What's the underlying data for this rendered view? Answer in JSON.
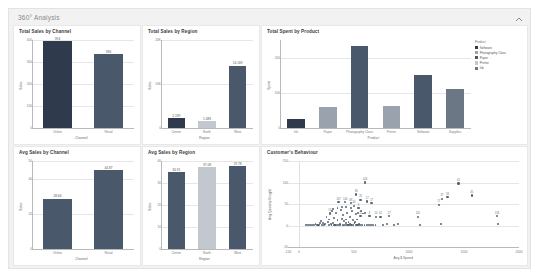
{
  "dashboard": {
    "title": "360° Analysis",
    "collapse_icon": "chevron-up-icon",
    "panel_bg": "#f2f2f2",
    "card_bg": "#ffffff"
  },
  "colors": {
    "dark_navy": "#2f3b4c",
    "slate": "#49586b",
    "mid_gray": "#9aa3ad",
    "light_gray": "#c2c8ce",
    "accent_blue": "#3b4a5a",
    "grid": "#e6e6e6"
  },
  "legend": {
    "title": "Product",
    "items": [
      {
        "label": "Software",
        "color": "#2f3b4c"
      },
      {
        "label": "Photography Class",
        "color": "#9aa3ad"
      },
      {
        "label": "Paper",
        "color": "#49586b"
      },
      {
        "label": "Printer",
        "color": "#c2c8ce"
      },
      {
        "label": "Ink",
        "color": "#6b7785"
      }
    ]
  },
  "chart_data": [
    {
      "type": "bar",
      "id": "total-sales-by-channel",
      "title": "Total Sales by Channel",
      "xlabel": "Channel",
      "ylabel": "Sales",
      "categories": [
        "Online",
        "Retail"
      ],
      "values": [
        394,
        336
      ],
      "value_labels": [
        "394",
        "336"
      ],
      "colors": [
        "#2f3b4c",
        "#49586b"
      ],
      "ylim": [
        0,
        400
      ],
      "yticks": [
        0,
        100,
        200,
        300,
        400
      ],
      "ytick_labels": [
        "0",
        "100",
        "200",
        "300",
        "400"
      ],
      "grid": true
    },
    {
      "type": "bar",
      "id": "total-sales-by-region",
      "title": "Total Sales by Region",
      "xlabel": "Region",
      "ylabel": "Sales",
      "categories": [
        "Center",
        "North",
        "West"
      ],
      "values": [
        2199,
        1483,
        14169
      ],
      "value_labels": [
        "2,199",
        "1,483",
        "14,169"
      ],
      "colors": [
        "#2f3b4c",
        "#c2c8ce",
        "#49586b"
      ],
      "ylim": [
        0,
        20000
      ],
      "yticks": [
        0,
        10000,
        20000
      ],
      "ytick_labels": [
        "0",
        "10K",
        "20K"
      ],
      "grid": true
    },
    {
      "type": "bar",
      "id": "total-spent-by-product",
      "title": "Total Spent by Product",
      "xlabel": "Product",
      "ylabel": "Spent",
      "categories": [
        "Ink",
        "Paper",
        "Photography Class",
        "Printer",
        "Software",
        "Supplies"
      ],
      "values": [
        25,
        60,
        232,
        62,
        150,
        110
      ],
      "colors": [
        "#2f3b4c",
        "#9aa3ad",
        "#49586b",
        "#9aa3ad",
        "#49586b",
        "#6b7785"
      ],
      "ylim": [
        0,
        250
      ],
      "yticks": [
        0,
        100,
        200
      ],
      "ytick_labels": [
        "0",
        "100",
        "200"
      ],
      "grid": true
    },
    {
      "type": "bar",
      "id": "avg-sales-by-channel",
      "title": "Avg Sales by Channel",
      "xlabel": "Channel",
      "ylabel": "Sales",
      "categories": [
        "Online",
        "Retail"
      ],
      "values": [
        28.64,
        44.87
      ],
      "value_labels": [
        "28.64",
        "44.87"
      ],
      "colors": [
        "#49586b",
        "#49586b"
      ],
      "ylim": [
        0,
        50
      ],
      "yticks": [
        0,
        20,
        40,
        50
      ],
      "ytick_labels": [
        "0",
        "20",
        "40",
        "50"
      ],
      "grid": true
    },
    {
      "type": "bar",
      "id": "avg-sales-by-region",
      "title": "Avg Sales by Region",
      "xlabel": "Region",
      "ylabel": "Sales",
      "categories": [
        "Center",
        "North",
        "West"
      ],
      "values": [
        34.91,
        37.08,
        37.78
      ],
      "value_labels": [
        "34.91",
        "37.08",
        "37.78"
      ],
      "colors": [
        "#49586b",
        "#c2c8ce",
        "#49586b"
      ],
      "ylim": [
        0,
        40
      ],
      "yticks": [
        0,
        10,
        20,
        30,
        40
      ],
      "ytick_labels": [
        "0",
        "10",
        "20",
        "30",
        "40"
      ],
      "grid": true
    },
    {
      "type": "scatter",
      "id": "customers-behaviour",
      "title": "Customer's Behaviour",
      "xlabel": "Avg $ Spend",
      "ylabel": "Avg Quantity Bought",
      "xlim": [
        -100,
        2000
      ],
      "ylim": [
        -50,
        150
      ],
      "xticks": [
        -100,
        0,
        500,
        1000,
        1500,
        2000
      ],
      "xtick_labels": [
        "-100",
        "0",
        "500",
        "1000",
        "1500",
        "2000"
      ],
      "yticks": [
        -50,
        0,
        50,
        100,
        150
      ],
      "ytick_labels": [
        "-50",
        "0",
        "50",
        "100",
        "150"
      ],
      "grid": true,
      "points": [
        {
          "x": 600,
          "y": 100,
          "label": "144"
        },
        {
          "x": 1450,
          "y": 98,
          "label": "41"
        },
        {
          "x": 1570,
          "y": 70,
          "label": "45"
        },
        {
          "x": 1300,
          "y": 62,
          "label": "37"
        },
        {
          "x": 1350,
          "y": 66,
          "label": "33"
        },
        {
          "x": 1270,
          "y": 48,
          "label": "17"
        },
        {
          "x": 520,
          "y": 72,
          "label": "36"
        },
        {
          "x": 560,
          "y": 60,
          "label": "25"
        },
        {
          "x": 620,
          "y": 56,
          "label": "17"
        },
        {
          "x": 660,
          "y": 52,
          "label": "17"
        },
        {
          "x": 360,
          "y": 54,
          "label": "107"
        },
        {
          "x": 420,
          "y": 54,
          "label": "144"
        },
        {
          "x": 470,
          "y": 52,
          "label": "48"
        },
        {
          "x": 500,
          "y": 46,
          "label": "40"
        },
        {
          "x": 540,
          "y": 40,
          "label": "8"
        },
        {
          "x": 280,
          "y": 28,
          "label": "13"
        },
        {
          "x": 560,
          "y": 22,
          "label": "12"
        },
        {
          "x": 640,
          "y": 22,
          "label": "8"
        },
        {
          "x": 700,
          "y": 20,
          "label": "24"
        },
        {
          "x": 740,
          "y": 20,
          "label": "42"
        },
        {
          "x": 820,
          "y": 22,
          "label": "27"
        },
        {
          "x": 1080,
          "y": 20,
          "label": "120"
        },
        {
          "x": 1800,
          "y": 22,
          "label": "133"
        },
        {
          "x": 1810,
          "y": 4,
          "label": ""
        },
        {
          "x": 300,
          "y": 34,
          "label": ""
        },
        {
          "x": 340,
          "y": 30,
          "label": ""
        },
        {
          "x": 380,
          "y": 36,
          "label": ""
        },
        {
          "x": 400,
          "y": 24,
          "label": ""
        },
        {
          "x": 440,
          "y": 30,
          "label": ""
        },
        {
          "x": 460,
          "y": 20,
          "label": ""
        },
        {
          "x": 480,
          "y": 34,
          "label": ""
        },
        {
          "x": 250,
          "y": 20,
          "label": ""
        },
        {
          "x": 270,
          "y": 14,
          "label": ""
        },
        {
          "x": 320,
          "y": 18,
          "label": ""
        },
        {
          "x": 350,
          "y": 12,
          "label": ""
        },
        {
          "x": 390,
          "y": 16,
          "label": ""
        },
        {
          "x": 410,
          "y": 10,
          "label": ""
        },
        {
          "x": 430,
          "y": 14,
          "label": ""
        },
        {
          "x": 450,
          "y": 8,
          "label": ""
        },
        {
          "x": 490,
          "y": 12,
          "label": ""
        },
        {
          "x": 510,
          "y": 8,
          "label": ""
        },
        {
          "x": 530,
          "y": 14,
          "label": ""
        },
        {
          "x": 200,
          "y": 10,
          "label": ""
        },
        {
          "x": 220,
          "y": 6,
          "label": ""
        },
        {
          "x": 240,
          "y": 4,
          "label": ""
        },
        {
          "x": 260,
          "y": 8,
          "label": ""
        },
        {
          "x": 290,
          "y": 4,
          "label": ""
        },
        {
          "x": 310,
          "y": 6,
          "label": ""
        },
        {
          "x": 330,
          "y": 2,
          "label": ""
        },
        {
          "x": 370,
          "y": 4,
          "label": ""
        },
        {
          "x": 405,
          "y": 2,
          "label": ""
        },
        {
          "x": 425,
          "y": 6,
          "label": ""
        },
        {
          "x": 445,
          "y": 2,
          "label": ""
        },
        {
          "x": 465,
          "y": 4,
          "label": ""
        },
        {
          "x": 485,
          "y": 2,
          "label": ""
        },
        {
          "x": 505,
          "y": 6,
          "label": ""
        },
        {
          "x": 525,
          "y": 2,
          "label": ""
        },
        {
          "x": 545,
          "y": 4,
          "label": ""
        },
        {
          "x": 150,
          "y": 4,
          "label": ""
        },
        {
          "x": 170,
          "y": 2,
          "label": ""
        },
        {
          "x": 190,
          "y": 6,
          "label": ""
        },
        {
          "x": 210,
          "y": 2,
          "label": ""
        },
        {
          "x": 230,
          "y": 2,
          "label": ""
        },
        {
          "x": 275,
          "y": 2,
          "label": ""
        },
        {
          "x": 295,
          "y": 2,
          "label": ""
        },
        {
          "x": 315,
          "y": 2,
          "label": ""
        },
        {
          "x": 335,
          "y": 2,
          "label": ""
        },
        {
          "x": 355,
          "y": 2,
          "label": ""
        },
        {
          "x": 375,
          "y": 2,
          "label": ""
        },
        {
          "x": 395,
          "y": 2,
          "label": ""
        },
        {
          "x": 415,
          "y": 2,
          "label": ""
        },
        {
          "x": 435,
          "y": 2,
          "label": ""
        },
        {
          "x": 455,
          "y": 2,
          "label": ""
        },
        {
          "x": 475,
          "y": 2,
          "label": ""
        },
        {
          "x": 495,
          "y": 2,
          "label": ""
        },
        {
          "x": 515,
          "y": 2,
          "label": ""
        },
        {
          "x": 535,
          "y": 2,
          "label": ""
        },
        {
          "x": 555,
          "y": 2,
          "label": ""
        },
        {
          "x": 575,
          "y": 2,
          "label": ""
        },
        {
          "x": 595,
          "y": 2,
          "label": ""
        },
        {
          "x": 615,
          "y": 2,
          "label": ""
        },
        {
          "x": 635,
          "y": 2,
          "label": ""
        },
        {
          "x": 655,
          "y": 2,
          "label": ""
        },
        {
          "x": 675,
          "y": 2,
          "label": ""
        },
        {
          "x": 695,
          "y": 2,
          "label": ""
        },
        {
          "x": 120,
          "y": 2,
          "label": ""
        },
        {
          "x": 140,
          "y": 2,
          "label": ""
        },
        {
          "x": 160,
          "y": 2,
          "label": ""
        },
        {
          "x": 180,
          "y": 2,
          "label": ""
        },
        {
          "x": 100,
          "y": 2,
          "label": ""
        },
        {
          "x": 80,
          "y": 2,
          "label": ""
        },
        {
          "x": 60,
          "y": 2,
          "label": ""
        },
        {
          "x": 760,
          "y": 2,
          "label": ""
        },
        {
          "x": 800,
          "y": 4,
          "label": ""
        },
        {
          "x": 860,
          "y": 2,
          "label": ""
        },
        {
          "x": 900,
          "y": 4,
          "label": ""
        },
        {
          "x": 1100,
          "y": 2,
          "label": ""
        },
        {
          "x": 1290,
          "y": 4,
          "label": ""
        },
        {
          "x": 560,
          "y": 34,
          "label": ""
        },
        {
          "x": 580,
          "y": 28,
          "label": ""
        },
        {
          "x": 600,
          "y": 30,
          "label": ""
        },
        {
          "x": 520,
          "y": 26,
          "label": ""
        },
        {
          "x": 540,
          "y": 30,
          "label": ""
        },
        {
          "x": 470,
          "y": 40,
          "label": ""
        },
        {
          "x": 430,
          "y": 42,
          "label": ""
        },
        {
          "x": 390,
          "y": 44,
          "label": ""
        },
        {
          "x": 350,
          "y": 40,
          "label": ""
        },
        {
          "x": 310,
          "y": 38,
          "label": ""
        }
      ]
    }
  ]
}
